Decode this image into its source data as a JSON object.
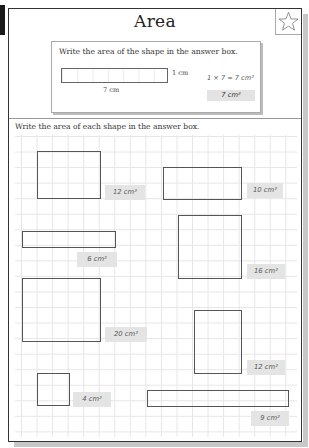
{
  "header": {
    "title": "Area",
    "star_icon": "star-outline-icon"
  },
  "example": {
    "instruction": "Write the area of the shape in the answer box.",
    "height_label": "1 cm",
    "width_label": "7 cm",
    "calculation": "1 × 7 =  7 cm²",
    "answer": "7 cm²"
  },
  "section": {
    "instruction": "Write the area of each shape in the answer box."
  },
  "shapes": [
    {
      "id": "shape-12a",
      "answer": "12 cm²"
    },
    {
      "id": "shape-10",
      "answer": "10 cm²"
    },
    {
      "id": "shape-16",
      "answer": "16 cm²"
    },
    {
      "id": "shape-6",
      "answer": "6 cm²"
    },
    {
      "id": "shape-20",
      "answer": "20 cm²"
    },
    {
      "id": "shape-12b",
      "answer": "12 cm²"
    },
    {
      "id": "shape-4",
      "answer": "4 cm²"
    },
    {
      "id": "shape-9",
      "answer": "9 cm²"
    }
  ],
  "colors": {
    "answer_box": "#e4e4e4",
    "border": "#333333",
    "grid_line": "#e6e6e6"
  }
}
